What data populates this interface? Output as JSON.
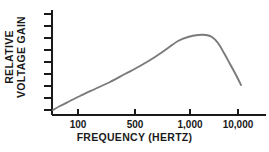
{
  "chart_data": {
    "type": "line",
    "title": "",
    "xlabel": "FREQUENCY (HERTZ)",
    "ylabel_lines": [
      "RELATIVE",
      "VOLTAGE GAIN"
    ],
    "ylabel": "RELATIVE VOLTAGE GAIN",
    "x_scale": "log",
    "x_tick_labels": [
      "100",
      "500",
      "1,000",
      "10,000"
    ],
    "x_tick_values": [
      100,
      500,
      1000,
      10000
    ],
    "xlim": [
      40,
      30000
    ],
    "y_tick_labels": [],
    "y_tick_count": 9,
    "ylim": [
      0,
      10
    ],
    "grid": false,
    "legend": false,
    "series": [
      {
        "name": "Relative voltage gain",
        "x": [
          45,
          60,
          80,
          100,
          150,
          200,
          300,
          500,
          700,
          1000,
          1500,
          2000,
          2600,
          3200,
          4500,
          7000,
          11000,
          14000
        ],
        "y": [
          0.55,
          0.8,
          1.15,
          1.5,
          2.3,
          3.0,
          4.1,
          5.6,
          6.6,
          7.6,
          8.25,
          8.35,
          8.1,
          7.4,
          6.1,
          4.4,
          3.0,
          2.6
        ]
      }
    ],
    "colors": {
      "curve": "#7a7a7a",
      "axis": "#1a1a1a",
      "text": "#1a1a1a",
      "background": "#ffffff"
    }
  },
  "axis_geometry": {
    "origin_x": 52,
    "origin_y": 115,
    "axis_top_y": 10,
    "axis_right_x": 266,
    "x_tick_px": [
      78,
      135,
      190,
      238
    ],
    "y_tick_px": [
      14,
      26,
      38,
      50,
      62,
      74,
      86,
      98,
      110
    ],
    "y_tick_length": 8,
    "x_tick_length": 6,
    "curve_points_px": [
      [
        53,
        110
      ],
      [
        60,
        106
      ],
      [
        70,
        101
      ],
      [
        80,
        96
      ],
      [
        95,
        89
      ],
      [
        110,
        82
      ],
      [
        125,
        74
      ],
      [
        140,
        66
      ],
      [
        155,
        57
      ],
      [
        168,
        48
      ],
      [
        178,
        41
      ],
      [
        188,
        37
      ],
      [
        198,
        35
      ],
      [
        206,
        35
      ],
      [
        212,
        37
      ],
      [
        218,
        43
      ],
      [
        224,
        53
      ],
      [
        230,
        64
      ],
      [
        236,
        75
      ],
      [
        241,
        85
      ]
    ]
  }
}
